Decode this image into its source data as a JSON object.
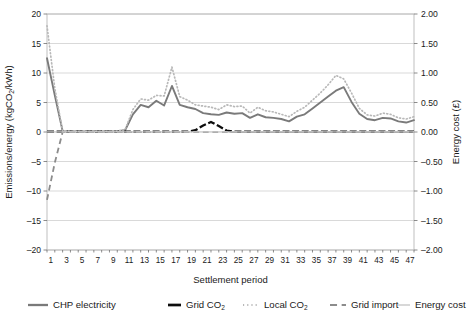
{
  "chart_data": {
    "type": "line",
    "title": "",
    "xlabel": "Settlement period",
    "ylabel": "Emissions/energy (kgCO2/kWh)",
    "ylabel_parts": {
      "pre": "Emissions/energy (kgCO",
      "sub": "2",
      "post": "/kWh)"
    },
    "y2label": "Energy cost (£)",
    "ylim": [
      -20,
      20
    ],
    "y2lim": [
      -2.0,
      2.0
    ],
    "yticks": [
      20,
      15,
      10,
      5,
      0,
      -5,
      -10,
      -15,
      -20
    ],
    "ytick_labels": [
      "20",
      "15",
      "10",
      "5",
      "0",
      "–5",
      "–10",
      "–15",
      "–20"
    ],
    "y2ticks": [
      2.0,
      1.5,
      1.0,
      0.5,
      0.0,
      -0.5,
      -1.0,
      -1.5,
      -2.0
    ],
    "y2tick_labels": [
      "2.00",
      "1.50",
      "1.00",
      "0.50",
      "0.00",
      "–0.50",
      "–1.00",
      "–1.50",
      "–2.00"
    ],
    "xlim": [
      1,
      48
    ],
    "x": [
      1,
      2,
      3,
      4,
      5,
      6,
      7,
      8,
      9,
      10,
      11,
      12,
      13,
      14,
      15,
      16,
      17,
      18,
      19,
      20,
      21,
      22,
      23,
      24,
      25,
      26,
      27,
      28,
      29,
      30,
      31,
      32,
      33,
      34,
      35,
      36,
      37,
      38,
      39,
      40,
      41,
      42,
      43,
      44,
      45,
      46,
      47,
      48
    ],
    "xtick_labels": [
      "1",
      "3",
      "5",
      "7",
      "9",
      "11",
      "13",
      "15",
      "17",
      "19",
      "21",
      "23",
      "25",
      "27",
      "29",
      "31",
      "33",
      "35",
      "37",
      "39",
      "41",
      "43",
      "45",
      "47"
    ],
    "grid": true,
    "legend_position": "bottom",
    "series": [
      {
        "name": "CHP electricity",
        "axis": "left",
        "color": "#7a7a7a",
        "style": "solid",
        "width": 1.9,
        "values": [
          12.5,
          6.2,
          0.15,
          0.1,
          0.1,
          0.1,
          0.12,
          0.1,
          0.1,
          0.12,
          0.3,
          0.5,
          0.6,
          0.4,
          0.35,
          0.4,
          0.35,
          0.3,
          0.4,
          0.5,
          1.2,
          3.2,
          4.6,
          5.0,
          4.4,
          5.1,
          5.2,
          5.5,
          6.0,
          8.6,
          5.6,
          5.0,
          4.6,
          4.5,
          4.3,
          4.2,
          3.5,
          3.8,
          3.5,
          3.3,
          2.9,
          3.5,
          3.2,
          3.9,
          4.0,
          4.4,
          4.9,
          5.6
        ]
      },
      {
        "name": "Grid CO2",
        "axis": "left",
        "color": "#0d0d0d",
        "style": "solid",
        "width": 2.3,
        "values": [
          0.05,
          0.05,
          0.05,
          0.05,
          0.05,
          0.05,
          0.05,
          0.05,
          0.05,
          0.05,
          0.05,
          0.05,
          0.05,
          0.05,
          0.05,
          0.05,
          0.05,
          0.05,
          0.05,
          0.05,
          0.05,
          0.05,
          0.05,
          0.05,
          0.05,
          0.05,
          0.05,
          0.05,
          0.05,
          0.05,
          0.05,
          0.05,
          0.05,
          0.05,
          0.05,
          0.05,
          0.05,
          0.05,
          0.05,
          0.05,
          0.05,
          0.05,
          0.05,
          0.05,
          0.05,
          0.05,
          0.05,
          0.05
        ]
      },
      {
        "name": "Local CO2",
        "axis": "left",
        "color": "#b8b8b8",
        "style": "dotted",
        "width": 1.7,
        "values": [
          18.0,
          7.4,
          0.2,
          0.12,
          0.12,
          0.12,
          0.14,
          0.12,
          0.12,
          0.15,
          0.35,
          0.6,
          0.75,
          0.5,
          0.4,
          0.45,
          0.4,
          0.35,
          0.45,
          0.6,
          1.6,
          4.2,
          6.0,
          6.3,
          5.4,
          6.3,
          6.5,
          6.6,
          7.4,
          11.3,
          7.0,
          6.0,
          5.5,
          5.2,
          5.0,
          4.9,
          4.0,
          4.4,
          4.0,
          3.9,
          3.4,
          4.2,
          3.8,
          4.6,
          4.7,
          5.3,
          5.9,
          6.7
        ]
      },
      {
        "name": "Grid import",
        "axis": "left",
        "color": "#8c8c8c",
        "style": "dashed",
        "width": 1.8,
        "values": [
          -11.5,
          -5.2,
          0.0,
          0.0,
          0.0,
          0.0,
          0.0,
          0.0,
          0.0,
          0.0,
          0.0,
          0.0,
          0.0,
          0.0,
          0.0,
          0.0,
          0.0,
          0.0,
          0.0,
          0.0,
          0.0,
          0.0,
          0.0,
          0.0,
          0.0,
          0.0,
          0.0,
          0.0,
          0.0,
          0.0,
          0.0,
          0.0,
          0.0,
          0.0,
          0.0,
          0.0,
          0.0,
          0.0,
          0.0,
          0.0,
          0.0,
          0.0,
          0.0,
          0.0,
          0.0,
          0.0,
          0.0,
          0.0
        ]
      },
      {
        "name": "Energy cost",
        "axis": "right",
        "color": "#cfcfcf",
        "style": "solid",
        "width": 1.2,
        "values": [
          0.0,
          0.0,
          0.0,
          0.0,
          0.0,
          0.0,
          0.0,
          0.0,
          0.0,
          0.0,
          0.0,
          0.0,
          0.0,
          0.0,
          0.0,
          0.0,
          0.0,
          0.0,
          0.0,
          0.0,
          0.0,
          0.0,
          0.0,
          0.0,
          0.0,
          0.0,
          0.0,
          0.0,
          0.0,
          0.0,
          0.0,
          0.0,
          0.0,
          0.0,
          0.0,
          0.0,
          0.0,
          0.0,
          0.0,
          0.0,
          0.0,
          0.0,
          0.0,
          0.0,
          0.0,
          0.0,
          0.0,
          0.0
        ]
      }
    ],
    "annotations": {
      "chp_detail": [
        12.5,
        6.2,
        0.15,
        0.1,
        0.1,
        0.1,
        0.12,
        0.1,
        0.1,
        0.12,
        0.3,
        3.0,
        4.6,
        4.2,
        5.3,
        4.5,
        7.8,
        4.6,
        4.2,
        3.9,
        3.2,
        3.0,
        2.9,
        3.3,
        3.1,
        3.2,
        2.4,
        3.0,
        2.5,
        2.4,
        2.2,
        1.8,
        2.6,
        3.0,
        4.0,
        5.0,
        6.0,
        7.0,
        7.6,
        5.1,
        3.1,
        2.2,
        2.0,
        2.4,
        2.3,
        1.8,
        1.6,
        2.0
      ],
      "local_detail": [
        18.0,
        7.4,
        0.2,
        0.12,
        0.12,
        0.12,
        0.14,
        0.12,
        0.12,
        0.15,
        0.4,
        3.8,
        5.6,
        5.4,
        6.2,
        6.1,
        11.0,
        6.0,
        5.4,
        4.6,
        4.4,
        4.2,
        3.8,
        4.6,
        4.3,
        4.4,
        3.2,
        4.2,
        3.6,
        3.4,
        3.0,
        2.6,
        3.5,
        4.2,
        5.4,
        6.6,
        8.0,
        9.6,
        9.0,
        6.6,
        4.0,
        2.9,
        2.7,
        3.2,
        3.0,
        2.4,
        2.2,
        2.6
      ]
    }
  },
  "legend": {
    "items": [
      {
        "label": "CHP electricity",
        "key": "chp-electricity"
      },
      {
        "label": "Grid CO",
        "sub": "2",
        "key": "grid-co2"
      },
      {
        "label": "Local CO",
        "sub": "2",
        "key": "local-co2"
      },
      {
        "label": "Grid import",
        "key": "grid-import"
      },
      {
        "label": "Energy cost",
        "key": "energy-cost"
      }
    ]
  }
}
